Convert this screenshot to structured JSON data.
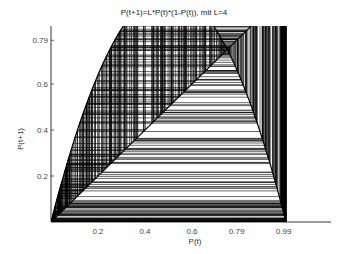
{
  "chart_data": {
    "type": "line",
    "title": "P(t+1)=L*P(t)*(1-P(t)), mit L=4",
    "xlabel": "P(t)",
    "ylabel": "P(t+1)",
    "L": 4,
    "x0": 0.01,
    "iterations": 400,
    "xlim": [
      0,
      1.19
    ],
    "ylim": [
      0,
      0.85
    ],
    "xticks": [
      0.2,
      0.4,
      0.6,
      0.79,
      0.99
    ],
    "xtick_labels": [
      "0.2",
      "0.4",
      "0.6",
      "0.79",
      "0.99"
    ],
    "yticks": [
      0.2,
      0.4,
      0.6,
      0.79
    ],
    "ytick_labels": [
      "0.2",
      "0.4",
      "0.6",
      "0.79"
    ],
    "series": [
      {
        "name": "cobweb iterations",
        "color": "#000000"
      },
      {
        "name": "diagonal y=x",
        "color": "#000000"
      },
      {
        "name": "parabola y=4x(1-x)",
        "color": "#000000"
      }
    ],
    "grid": false,
    "legend": false
  }
}
